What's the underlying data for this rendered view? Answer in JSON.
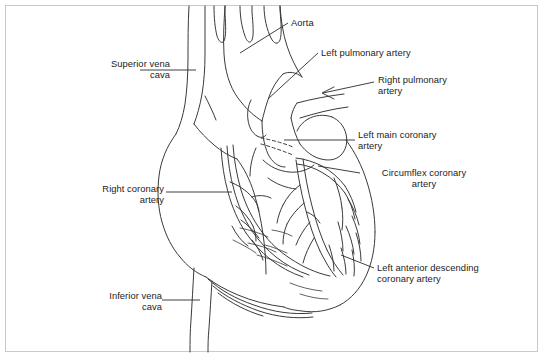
{
  "figure": {
    "background_color": "#ffffff",
    "frame_color": "#c9c9c9",
    "line_color": "#3a3a3a",
    "text_color": "#1c1c1c"
  },
  "labels": {
    "superior_vena_cava": "Superior vena\ncava",
    "aorta": "Aorta",
    "left_pulmonary_artery": "Left pulmonary artery",
    "right_pulmonary_artery": "Right pulmonary\nartery",
    "left_main_coronary_artery": "Left main coronary\nartery",
    "circumflex_coronary_artery": "Circumflex coronary\nartery",
    "right_coronary_artery": "Right coronary\nartery",
    "left_anterior_descending": "Left anterior descending\ncoronary artery",
    "inferior_vena_cava": "Inferior vena\ncava"
  },
  "callouts": [
    {
      "id": "superior-vena-cava",
      "text": "Superior vena\ncava",
      "align": "right",
      "x": 62,
      "y": 58,
      "width": 108,
      "leader": "horizontal"
    },
    {
      "id": "aorta",
      "text": "Aorta",
      "align": "left",
      "x": 292,
      "y": 18,
      "width": 60,
      "leader": "diagonal"
    },
    {
      "id": "left-pulmonary-artery",
      "text": "Left pulmonary artery",
      "align": "left",
      "x": 322,
      "y": 48,
      "width": 130,
      "leader": "diagonal"
    },
    {
      "id": "right-pulmonary-artery",
      "text": "Right pulmonary\nartery",
      "align": "left",
      "x": 377,
      "y": 75,
      "width": 100,
      "leader": "arrow"
    },
    {
      "id": "left-main-coronary-artery",
      "text": "Left main coronary\nartery",
      "align": "left",
      "x": 357,
      "y": 130,
      "width": 115,
      "leader": "horizontal"
    },
    {
      "id": "circumflex-coronary-artery",
      "text": "Circumflex coronary\nartery",
      "align": "left",
      "x": 362,
      "y": 168,
      "width": 118,
      "leader": "diagonal"
    },
    {
      "id": "right-coronary-artery",
      "text": "Right coronary\nartery",
      "align": "right",
      "x": 52,
      "y": 183,
      "width": 112,
      "leader": "horizontal"
    },
    {
      "id": "left-anterior-descending",
      "text": "Left anterior descending\ncoronary artery",
      "align": "left",
      "x": 376,
      "y": 263,
      "width": 150,
      "leader": "diagonal"
    },
    {
      "id": "inferior-vena-cava",
      "text": "Inferior vena\ncava",
      "align": "right",
      "x": 58,
      "y": 290,
      "width": 108,
      "leader": "horizontal"
    }
  ]
}
